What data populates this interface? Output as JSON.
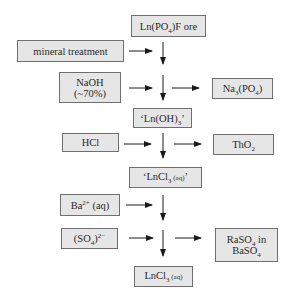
{
  "diagram": {
    "nodes": {
      "ore": {
        "main": "Ln(PO",
        "sub": "4",
        "rest": ")F ore"
      },
      "mineral": {
        "label": "mineral treatment"
      },
      "naoh": {
        "line1": "NaOH",
        "line2": "(~70%)"
      },
      "na3po4": {
        "a": "Na",
        "sub1": "3",
        "b": "(PO",
        "sub2": "4",
        "c": ")"
      },
      "lnoh3": {
        "a": "‘Ln(OH)",
        "sub": "3",
        "b": "’"
      },
      "hcl": {
        "label": "HCl"
      },
      "tho2": {
        "a": "ThO",
        "sub": "2"
      },
      "lncl3_q": {
        "a": "‘LnCl",
        "sub": "3",
        "aq": " (aq)",
        "b": "’"
      },
      "ba": {
        "a": "Ba",
        "sup": "2+",
        "b": " (aq)"
      },
      "so4": {
        "a": "(SO",
        "sub": "4",
        "b": ")",
        "sup": "2−"
      },
      "raso4": {
        "a": "RaSO",
        "sub1": "4",
        "b": " in",
        "c": "BaSO",
        "sub2": "4"
      },
      "lncl3": {
        "a": "LnCl",
        "sub": "3",
        "aq": " (aq)"
      }
    },
    "edges": [
      {
        "from": "ore",
        "to": "lnoh3",
        "type": "main-flow"
      },
      {
        "from": "mineral",
        "to": "main-flow",
        "type": "input"
      },
      {
        "from": "naoh",
        "to": "main-flow",
        "type": "input"
      },
      {
        "from": "main-flow",
        "to": "na3po4",
        "type": "output"
      },
      {
        "from": "lnoh3",
        "to": "lncl3_q",
        "type": "main-flow"
      },
      {
        "from": "hcl",
        "to": "main-flow",
        "type": "input"
      },
      {
        "from": "main-flow",
        "to": "tho2",
        "type": "output"
      },
      {
        "from": "lncl3_q",
        "to": "lncl3",
        "type": "main-flow"
      },
      {
        "from": "ba",
        "to": "main-flow",
        "type": "input"
      },
      {
        "from": "so4",
        "to": "main-flow",
        "type": "input"
      },
      {
        "from": "main-flow",
        "to": "raso4",
        "type": "output"
      }
    ],
    "colors": {
      "box_fill": "#e6e6e6",
      "box_border": "#6f6f6f",
      "arrow": "#1a1a1a"
    }
  }
}
